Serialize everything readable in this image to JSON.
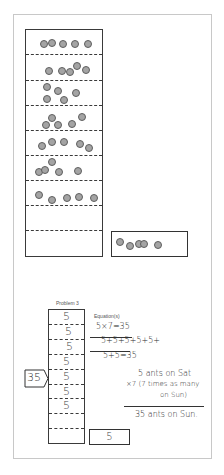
{
  "top_section": {
    "tape_rows": 9,
    "dot_rows": [
      {
        "row": 1,
        "count": 5
      },
      {
        "row": 2,
        "count": 5
      },
      {
        "row": 3,
        "count": 5
      },
      {
        "row": 4,
        "count": 5
      },
      {
        "row": 5,
        "count": 5
      },
      {
        "row": 6,
        "count": 5
      },
      {
        "row": 7,
        "count": 5
      },
      {
        "row": 8,
        "count": 0
      },
      {
        "row": 9,
        "count": 0
      }
    ],
    "small_box_dot_count": 5
  },
  "problem": {
    "label": "Problem 3",
    "equation_label": "Equation(s)",
    "tape_values": [
      "5",
      "5",
      "5",
      "5",
      "5",
      "5",
      "5",
      "",
      ""
    ],
    "total_label": "35",
    "answer_box": "5",
    "equations": [
      "5×7=35",
      "5+5+5+5+5+",
      "5+5=35"
    ],
    "work_lines": [
      "5 ants on Sat",
      "×7 (7 times as many",
      "on Sun)",
      "35 ants on Sun."
    ]
  },
  "colors": {
    "dot_fill": "#a4a4a4",
    "dot_stroke": "#5f5f5f",
    "line": "#333333",
    "frame": "#c8c8c8"
  }
}
